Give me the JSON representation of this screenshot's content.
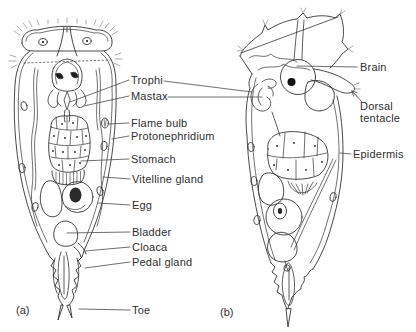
{
  "colors": {
    "background": "#ffffff",
    "line": "#333333",
    "leader_line": "#4a4a4a",
    "text": "#2f2f2f",
    "fill_dark": "#1c1c1c"
  },
  "panels": {
    "a": {
      "caption": "(a)"
    },
    "b": {
      "caption": "(b)"
    }
  },
  "labels": {
    "trophi": "Trophi",
    "mastax": "Mastax",
    "flame_bulb": "Flame bulb",
    "protonephridium": "Protonephridium",
    "stomach": "Stomach",
    "vitelline_gland": "Vitelline gland",
    "egg": "Egg",
    "bladder": "Bladder",
    "cloaca": "Cloaca",
    "pedal_gland": "Pedal gland",
    "toe": "Toe",
    "brain": "Brain",
    "dorsal_tentacle": "Dorsal tentacle",
    "epidermis": "Epidermis"
  }
}
